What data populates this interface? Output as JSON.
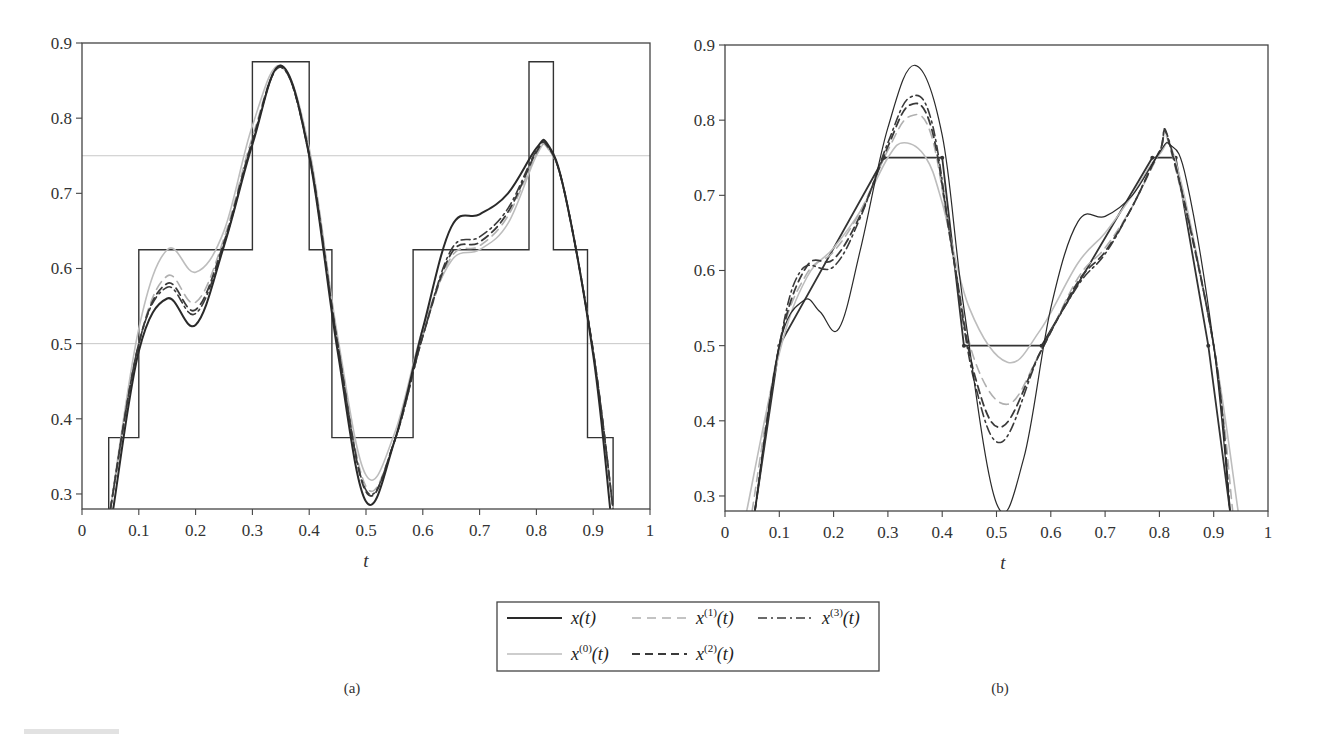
{
  "figure": {
    "width": 1327,
    "height": 734,
    "caption_fragment": "FIGURE"
  },
  "legend": {
    "entries": [
      {
        "key": "x",
        "label": "x",
        "sup": "",
        "arg": "(t)",
        "style": "solid-dark"
      },
      {
        "key": "x1",
        "label": "x",
        "sup": "(1)",
        "arg": "(t)",
        "style": "dashed-light"
      },
      {
        "key": "x3",
        "label": "x",
        "sup": "(3)",
        "arg": "(t)",
        "style": "dashdot-dark"
      },
      {
        "key": "x0",
        "label": "x",
        "sup": "(0)",
        "arg": "(t)",
        "style": "solid-light"
      },
      {
        "key": "x2",
        "label": "x",
        "sup": "(2)",
        "arg": "(t)",
        "style": "dashed-dark"
      }
    ]
  },
  "styles": {
    "solid-dark": {
      "color": "#2a2a2a",
      "width": 2.0,
      "dash": ""
    },
    "solid-light": {
      "color": "#bdbdbd",
      "width": 1.6,
      "dash": ""
    },
    "dashed-light": {
      "color": "#b0b0b0",
      "width": 1.6,
      "dash": "9 6"
    },
    "dashed-dark": {
      "color": "#3a3a3a",
      "width": 1.8,
      "dash": "8 5"
    },
    "dashdot-dark": {
      "color": "#3a3a3a",
      "width": 1.6,
      "dash": "9 4 2 4"
    },
    "solid-thin": {
      "color": "#2a2a2a",
      "width": 1.2,
      "dash": ""
    }
  },
  "chart_data": [
    {
      "id": "a",
      "panel_label": "(a)",
      "type": "line",
      "title": "",
      "xlabel": "t",
      "ylabel": "",
      "xlim": [
        0,
        1
      ],
      "ylim": [
        0.28,
        0.9
      ],
      "grid": false,
      "xticks": [
        0,
        0.1,
        0.2,
        0.3,
        0.4,
        0.5,
        0.6,
        0.7,
        0.8,
        0.9,
        1
      ],
      "xtick_labels": [
        "0",
        "0.1",
        "0.2",
        "0.3",
        "0.4",
        "0.5",
        "0.6",
        "0.7",
        "0.8",
        "0.9",
        "1"
      ],
      "yticks": [
        0.3,
        0.4,
        0.5,
        0.6,
        0.7,
        0.8,
        0.9
      ],
      "ytick_labels": [
        "0.3",
        "0.4",
        "0.5",
        "0.6",
        "0.7",
        "0.8",
        "0.9"
      ],
      "reference_lines": [
        {
          "y": 0.75,
          "color": "#c8c8c8"
        },
        {
          "y": 0.5,
          "color": "#c8c8c8"
        }
      ],
      "step_function": {
        "x": [
          0.047,
          0.047,
          0.1,
          0.1,
          0.3,
          0.3,
          0.4,
          0.4,
          0.44,
          0.44,
          0.583,
          0.583,
          0.787,
          0.787,
          0.83,
          0.83,
          0.89,
          0.89,
          0.935,
          0.935
        ],
        "y": [
          0.28,
          0.375,
          0.375,
          0.625,
          0.625,
          0.875,
          0.875,
          0.625,
          0.625,
          0.375,
          0.375,
          0.625,
          0.625,
          0.875,
          0.875,
          0.625,
          0.625,
          0.375,
          0.375,
          0.28
        ]
      },
      "series": [
        {
          "name": "x0",
          "style": "solid-light",
          "x": [
            0.05,
            0.1,
            0.15,
            0.2,
            0.25,
            0.3,
            0.35,
            0.4,
            0.45,
            0.5,
            0.55,
            0.6,
            0.65,
            0.7,
            0.75,
            0.8,
            0.82,
            0.85,
            0.9,
            0.935
          ],
          "y": [
            0.28,
            0.52,
            0.625,
            0.595,
            0.65,
            0.79,
            0.87,
            0.76,
            0.51,
            0.325,
            0.38,
            0.52,
            0.61,
            0.625,
            0.66,
            0.75,
            0.76,
            0.7,
            0.49,
            0.28
          ]
        },
        {
          "name": "x1",
          "style": "dashed-light",
          "x": [
            0.05,
            0.1,
            0.15,
            0.2,
            0.25,
            0.3,
            0.35,
            0.4,
            0.45,
            0.5,
            0.55,
            0.6,
            0.65,
            0.7,
            0.75,
            0.8,
            0.82,
            0.85,
            0.9,
            0.935
          ],
          "y": [
            0.28,
            0.5,
            0.59,
            0.555,
            0.64,
            0.775,
            0.868,
            0.755,
            0.505,
            0.31,
            0.37,
            0.51,
            0.615,
            0.63,
            0.67,
            0.752,
            0.76,
            0.7,
            0.49,
            0.28
          ]
        },
        {
          "name": "x2",
          "style": "dashed-dark",
          "x": [
            0.05,
            0.1,
            0.15,
            0.2,
            0.25,
            0.3,
            0.35,
            0.4,
            0.45,
            0.5,
            0.55,
            0.6,
            0.65,
            0.7,
            0.75,
            0.8,
            0.82,
            0.85,
            0.9,
            0.935
          ],
          "y": [
            0.28,
            0.5,
            0.58,
            0.545,
            0.635,
            0.77,
            0.868,
            0.752,
            0.5,
            0.303,
            0.37,
            0.51,
            0.62,
            0.635,
            0.675,
            0.755,
            0.762,
            0.7,
            0.49,
            0.28
          ]
        },
        {
          "name": "x3",
          "style": "dashdot-dark",
          "x": [
            0.05,
            0.1,
            0.15,
            0.2,
            0.25,
            0.3,
            0.35,
            0.4,
            0.45,
            0.5,
            0.55,
            0.6,
            0.65,
            0.7,
            0.75,
            0.8,
            0.82,
            0.85,
            0.9,
            0.935
          ],
          "y": [
            0.28,
            0.5,
            0.575,
            0.54,
            0.632,
            0.768,
            0.868,
            0.75,
            0.5,
            0.305,
            0.37,
            0.51,
            0.625,
            0.642,
            0.68,
            0.757,
            0.763,
            0.7,
            0.49,
            0.28
          ]
        },
        {
          "name": "x",
          "style": "solid-dark",
          "x": [
            0.055,
            0.1,
            0.15,
            0.2,
            0.25,
            0.3,
            0.35,
            0.4,
            0.45,
            0.5,
            0.55,
            0.6,
            0.65,
            0.7,
            0.75,
            0.8,
            0.82,
            0.85,
            0.9,
            0.93
          ],
          "y": [
            0.28,
            0.49,
            0.56,
            0.525,
            0.63,
            0.765,
            0.87,
            0.75,
            0.49,
            0.29,
            0.37,
            0.52,
            0.655,
            0.672,
            0.7,
            0.76,
            0.765,
            0.7,
            0.485,
            0.28
          ]
        }
      ]
    },
    {
      "id": "b",
      "panel_label": "(b)",
      "type": "line",
      "title": "",
      "xlabel": "t",
      "ylabel": "",
      "xlim": [
        0,
        1
      ],
      "ylim": [
        0.28,
        0.9
      ],
      "grid": false,
      "xticks": [
        0,
        0.1,
        0.2,
        0.3,
        0.4,
        0.5,
        0.6,
        0.7,
        0.8,
        0.9,
        1
      ],
      "xtick_labels": [
        "0",
        "0.1",
        "0.2",
        "0.3",
        "0.4",
        "0.5",
        "0.6",
        "0.7",
        "0.8",
        "0.9",
        "1"
      ],
      "yticks": [
        0.3,
        0.4,
        0.5,
        0.6,
        0.7,
        0.8,
        0.9
      ],
      "ytick_labels": [
        "0.3",
        "0.4",
        "0.5",
        "0.6",
        "0.7",
        "0.8",
        "0.9"
      ],
      "reference_lines": [],
      "polyline_function": {
        "x": [
          0.055,
          0.1,
          0.293,
          0.4,
          0.44,
          0.583,
          0.787,
          0.83,
          0.89,
          0.93
        ],
        "y": [
          0.28,
          0.5,
          0.75,
          0.75,
          0.5,
          0.5,
          0.75,
          0.75,
          0.5,
          0.28
        ]
      },
      "series": [
        {
          "name": "x0",
          "style": "solid-light",
          "x": [
            0.04,
            0.1,
            0.15,
            0.2,
            0.25,
            0.3,
            0.33,
            0.37,
            0.4,
            0.45,
            0.52,
            0.58,
            0.65,
            0.7,
            0.75,
            0.8,
            0.83,
            0.9,
            0.945
          ],
          "y": [
            0.28,
            0.49,
            0.59,
            0.63,
            0.68,
            0.75,
            0.77,
            0.75,
            0.69,
            0.55,
            0.478,
            0.52,
            0.61,
            0.65,
            0.7,
            0.755,
            0.745,
            0.5,
            0.28
          ]
        },
        {
          "name": "x1",
          "style": "dashed-light",
          "x": [
            0.05,
            0.1,
            0.15,
            0.2,
            0.25,
            0.3,
            0.34,
            0.38,
            0.42,
            0.46,
            0.52,
            0.58,
            0.65,
            0.7,
            0.75,
            0.8,
            0.82,
            0.9,
            0.935
          ],
          "y": [
            0.28,
            0.5,
            0.595,
            0.625,
            0.68,
            0.76,
            0.805,
            0.78,
            0.62,
            0.48,
            0.422,
            0.49,
            0.59,
            0.63,
            0.685,
            0.755,
            0.762,
            0.5,
            0.28
          ]
        },
        {
          "name": "x2",
          "style": "dashed-dark",
          "x": [
            0.055,
            0.1,
            0.15,
            0.2,
            0.25,
            0.3,
            0.34,
            0.38,
            0.42,
            0.46,
            0.51,
            0.58,
            0.65,
            0.7,
            0.75,
            0.8,
            0.82,
            0.9,
            0.93
          ],
          "y": [
            0.28,
            0.5,
            0.605,
            0.615,
            0.675,
            0.765,
            0.82,
            0.79,
            0.62,
            0.46,
            0.392,
            0.49,
            0.585,
            0.625,
            0.685,
            0.758,
            0.765,
            0.5,
            0.28
          ]
        },
        {
          "name": "x3",
          "style": "dashdot-dark",
          "x": [
            0.055,
            0.1,
            0.14,
            0.2,
            0.25,
            0.3,
            0.34,
            0.38,
            0.42,
            0.46,
            0.51,
            0.58,
            0.65,
            0.7,
            0.75,
            0.8,
            0.82,
            0.9,
            0.93
          ],
          "y": [
            0.28,
            0.5,
            0.6,
            0.605,
            0.672,
            0.77,
            0.83,
            0.8,
            0.62,
            0.45,
            0.372,
            0.49,
            0.58,
            0.622,
            0.685,
            0.758,
            0.767,
            0.5,
            0.28
          ]
        },
        {
          "name": "x",
          "style": "solid-thin",
          "x": [
            0.055,
            0.1,
            0.145,
            0.175,
            0.21,
            0.25,
            0.3,
            0.35,
            0.4,
            0.44,
            0.5,
            0.55,
            0.6,
            0.65,
            0.7,
            0.75,
            0.8,
            0.82,
            0.85,
            0.9,
            0.93
          ],
          "y": [
            0.28,
            0.5,
            0.56,
            0.545,
            0.523,
            0.63,
            0.79,
            0.873,
            0.78,
            0.55,
            0.29,
            0.35,
            0.55,
            0.665,
            0.672,
            0.7,
            0.757,
            0.767,
            0.72,
            0.5,
            0.28
          ]
        }
      ]
    }
  ]
}
